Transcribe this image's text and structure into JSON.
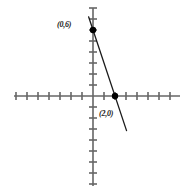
{
  "figure": {
    "title": "",
    "background_color": "#ffffff",
    "axis_color": "#666666",
    "line_color": "#1a1a1a",
    "point_color": "#000000",
    "label_color": "#1a1a1a"
  },
  "labels": {
    "y_intercept": "(0,6)",
    "x_intercept": "(2,0)"
  },
  "chart_data": {
    "type": "line",
    "title": "",
    "xlabel": "",
    "ylabel": "",
    "grid": false,
    "legend": null,
    "axis_style": "tick-marked cartesian axes, no numeric tick labels",
    "xlim": [
      -7,
      8
    ],
    "ylim": [
      -8,
      8
    ],
    "x_tick_count": 14,
    "y_tick_count": 15,
    "tick_step": 1,
    "series": [
      {
        "name": "line",
        "equation": "y = -3x + 6",
        "slope": -3,
        "intercept": 6,
        "x": [
          -0.4,
          3.05
        ],
        "y": [
          7.2,
          -3.15
        ],
        "points_marked": [
          {
            "label": "(0,6)",
            "x": 0,
            "y": 6
          },
          {
            "label": "(2,0)",
            "x": 2,
            "y": 0
          }
        ]
      }
    ]
  },
  "geometry": {
    "origin_px": {
      "x": 93,
      "y": 96
    },
    "unit_px": 11,
    "x_axis": {
      "x1": 14,
      "x2": 180,
      "y": 96
    },
    "y_axis": {
      "y1": 8,
      "y2": 186,
      "x": 93
    },
    "tick_half_len": 4,
    "point_radius": 3.2,
    "line": {
      "x1": 88,
      "y1": 9,
      "x2": 128,
      "y2": 131
    }
  }
}
